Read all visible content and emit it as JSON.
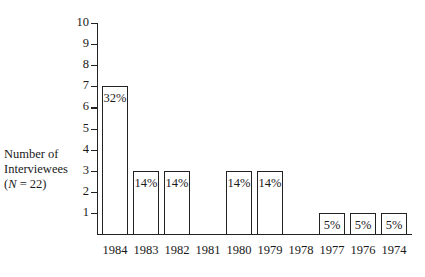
{
  "chart_data": {
    "type": "bar",
    "title": "",
    "xlabel": "",
    "ylabel": "Number of Interviewees (N = 22)",
    "ylabel_lines": [
      "Number of",
      "Interviewees",
      "(N = 22)"
    ],
    "ylim": [
      0,
      10
    ],
    "yticks": [
      1,
      2,
      3,
      4,
      5,
      6,
      7,
      8,
      9,
      10
    ],
    "categories": [
      "1984",
      "1983",
      "1982",
      "1981",
      "1980",
      "1979",
      "1978",
      "1977",
      "1976",
      "1974"
    ],
    "values": [
      7,
      3,
      3,
      0,
      3,
      3,
      0,
      1,
      1,
      1
    ],
    "bar_labels": [
      "32%",
      "14%",
      "14%",
      "",
      "14%",
      "14%",
      "",
      "5%",
      "5%",
      "5%"
    ],
    "grid": false,
    "legend": null
  }
}
